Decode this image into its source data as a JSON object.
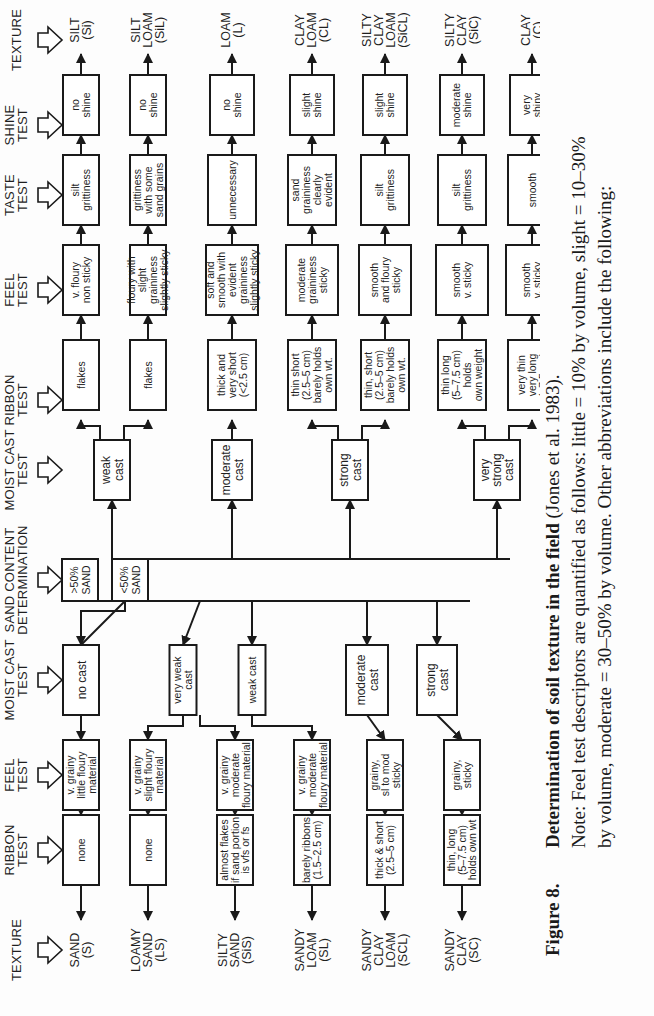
{
  "headers": {
    "left": [
      "TEXTURE",
      "RIBBON|TEST",
      "FEEL|TEST",
      "MOIST CAST|TEST",
      "SAND CONTENT|DETERMINATION",
      "MOIST CAST|TEST",
      "RIBBON|TEST",
      "FEEL|TEST",
      "TASTE|TEST",
      "SHINE|TEST",
      "TEXTURE"
    ]
  },
  "sand_content": {
    "gt50": "&gt;50%|SAND",
    "lt50": "<50%|SAND",
    "gt50_text": ">50%|SAND"
  },
  "sandy_branch": {
    "moist_cast": [
      "no cast",
      "very weak|cast",
      "weak cast",
      "moderate|cast",
      "strong|cast"
    ],
    "feel": [
      "v. grainy|little floury|material",
      "v. grainy|slight floury|material",
      "v. grainy|moderate|floury material",
      "v. grainy|moderate|floury material",
      "grainy,|sl to mod|sticky",
      "grainy,|sticky"
    ],
    "ribbon": [
      "none",
      "none",
      "almost flakes|if sand portion|is vfs or fs",
      "barely ribbons|(1.5–2.5 cm)",
      "thick & short|(2.5–5 cm)",
      "thin, long|(5–7.5 cm)|holds own wt"
    ],
    "texture": [
      "SAND|(S)",
      "LOAMY|SAND|(LS)",
      "SILTY|SAND|(SiS)",
      "SANDY|LOAM|(SL)",
      "SANDY|CLAY|LOAM|(SCL)",
      "SANDY|CLAY|(SC)"
    ]
  },
  "fine_branch": {
    "moist_cast": [
      "weak|cast",
      "moderate|cast",
      "strong|cast",
      "very|strong|cast"
    ],
    "ribbon": [
      "flakes",
      "flakes",
      "thick and|very short|(<2.5 cm)",
      "thin short|(2.5–5 cm)|barely holds|own wt.",
      "thin, short|(2.5–5 cm)|barely holds|own wt.",
      "thin long|(5–7.5 cm)|holds|own weight",
      "very thin|very long|(>7.5 cm)"
    ],
    "feel": [
      "v. floury|non sticky",
      "floury with|slight|graininess|slightly sticky",
      "soft and|smooth with|evident|graininess|slightly sticky",
      "moderate|graininess|sticky",
      "smooth|and floury|sticky",
      "smooth|v. sticky",
      "smooth|v. sticky"
    ],
    "taste": [
      "silt|grittiness",
      "grittiness|with some|sand grains",
      "unnecessary",
      "sand|graininess|clearly|evident",
      "silt|grittiness",
      "silt|grittiness",
      "smooth"
    ],
    "shine": [
      "no|shine",
      "no|shine",
      "no|shine",
      "slight|shine",
      "slight|shine",
      "moderate|shine",
      "very|shiny"
    ],
    "texture": [
      "SILT|(Si)",
      "SILT|LOAM|(SiL)",
      "LOAM|(L)",
      "CLAY|LOAM|(CL)",
      "SILTY|CLAY|LOAM|(SiCL)",
      "SILTY|CLAY|(SiC)",
      "CLAY|(C)"
    ]
  },
  "caption": {
    "figure_label": "Figure 8.",
    "title": "Determination of soil texture in the field",
    "citation": " (Jones et al. 1983).",
    "note_line1": "Note:  Feel test descriptors are quantified as follows:  little = 10% by volume, slight = 10–30%",
    "note_line2": "by volume, moderate = 30–50% by volume. Other abbreviations include the following:",
    "note_line3_partial": "sl = slight, mod = moderate, v. = very ... (<50%) ..."
  }
}
